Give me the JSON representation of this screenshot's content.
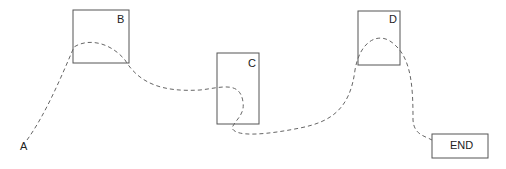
{
  "diagram": {
    "start_label": "A",
    "nodes": [
      {
        "id": "B",
        "label": "B"
      },
      {
        "id": "C",
        "label": "C"
      },
      {
        "id": "D",
        "label": "D"
      },
      {
        "id": "END",
        "label": "END"
      }
    ],
    "path": {
      "style": "dashed",
      "order": [
        "A",
        "B",
        "C",
        "D",
        "END"
      ]
    },
    "colors": {
      "stroke": "#555555",
      "path": "#666666",
      "text": "#222222"
    }
  }
}
